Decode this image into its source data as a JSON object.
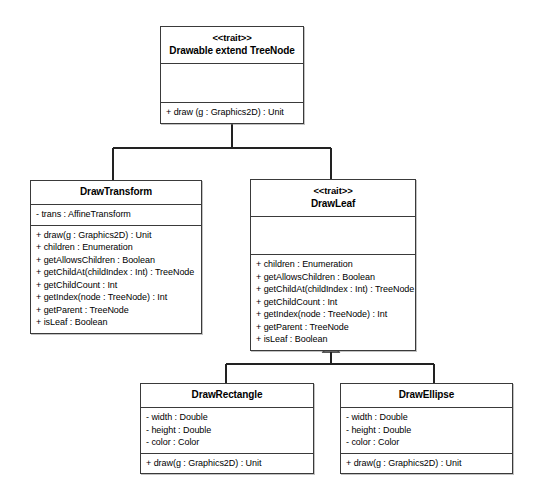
{
  "diagram": {
    "notation": "uml-class-diagram",
    "relationship_label": "generalization",
    "colors": {
      "background": "#ffffff",
      "border": "#3a3a3a",
      "connector": "#222222",
      "text": "#000000"
    }
  },
  "classes": {
    "drawable": {
      "stereotype": "<<trait>>",
      "name": "Drawable extend TreeNode",
      "attributes": [],
      "operations": [
        "+ draw (g : Graphics2D) : Unit"
      ]
    },
    "draw_transform": {
      "stereotype": "",
      "name": "DrawTransform",
      "attributes": [
        "- trans : AffineTransform"
      ],
      "operations": [
        "+ draw(g : Graphics2D) : Unit",
        "+ children : Enumeration",
        "+ getAllowsChildren : Boolean",
        "+ getChildAt(childIndex : Int) : TreeNode",
        "+ getChildCount : Int",
        "+ getIndex(node : TreeNode) : Int",
        "+ getParent : TreeNode",
        "+ isLeaf : Boolean"
      ]
    },
    "draw_leaf": {
      "stereotype": "<<trait>>",
      "name": "DrawLeaf",
      "attributes": [],
      "operations": [
        "+ children : Enumeration",
        "+ getAllowsChildren : Boolean",
        "+ getChildAt(childIndex : Int) : TreeNode",
        "+ getChildCount : Int",
        "+ getIndex(node : TreeNode) : Int",
        "+ getParent : TreeNode",
        "+ isLeaf : Boolean"
      ]
    },
    "draw_rectangle": {
      "stereotype": "",
      "name": "DrawRectangle",
      "attributes": [
        "- width : Double",
        "- height : Double",
        "- color : Color"
      ],
      "operations": [
        "+ draw(g : Graphics2D) : Unit"
      ]
    },
    "draw_ellipse": {
      "stereotype": "",
      "name": "DrawEllipse",
      "attributes": [
        "- width : Double",
        "- height : Double",
        "- color : Color"
      ],
      "operations": [
        "+ draw(g : Graphics2D) : Unit"
      ]
    }
  },
  "relationships": [
    {
      "type": "generalization",
      "from": "DrawTransform",
      "to": "Drawable extend TreeNode"
    },
    {
      "type": "generalization",
      "from": "DrawLeaf",
      "to": "Drawable extend TreeNode"
    },
    {
      "type": "generalization",
      "from": "DrawRectangle",
      "to": "DrawLeaf"
    },
    {
      "type": "generalization",
      "from": "DrawEllipse",
      "to": "DrawLeaf"
    }
  ]
}
